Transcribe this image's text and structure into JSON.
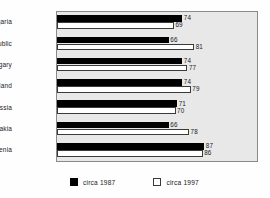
{
  "chart_data": {
    "type": "bar",
    "orientation": "horizontal",
    "title": "",
    "xlabel": "",
    "ylabel": "",
    "categories": [
      "Bulgaria",
      "Czech Republic",
      "Hungary",
      "Poland",
      "Russia",
      "Slovakia",
      "Slovenia"
    ],
    "series": [
      {
        "name": "circa 1987",
        "color": "#000000",
        "values": [
          74,
          66,
          74,
          74,
          71,
          66,
          87
        ]
      },
      {
        "name": "circa 1997",
        "color": "#ffffff",
        "values": [
          69,
          81,
          77,
          79,
          70,
          78,
          86
        ]
      }
    ],
    "xlim": [
      0,
      98
    ],
    "grid": false,
    "legend_position": "bottom",
    "data_labels": true,
    "plot_background": "#e8e8e8"
  },
  "legend": {
    "items": [
      {
        "label": "circa 1987",
        "swatch": "black-square-icon"
      },
      {
        "label": "circa 1997",
        "swatch": "white-square-icon"
      }
    ]
  }
}
